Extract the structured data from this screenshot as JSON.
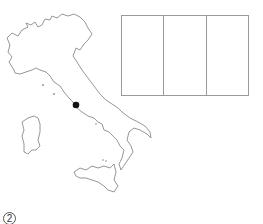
{
  "figure": {
    "map": {
      "country": "Italy",
      "marker": {
        "label": "capital-dot",
        "color": "#111111"
      },
      "outline_color": "#8a8a8a"
    },
    "flag": {
      "stripes": [
        {
          "color": "#ffffff"
        },
        {
          "color": "#ffffff"
        },
        {
          "color": "#ffffff"
        }
      ],
      "border_color": "#9a9a9a"
    },
    "item_number": "2"
  }
}
